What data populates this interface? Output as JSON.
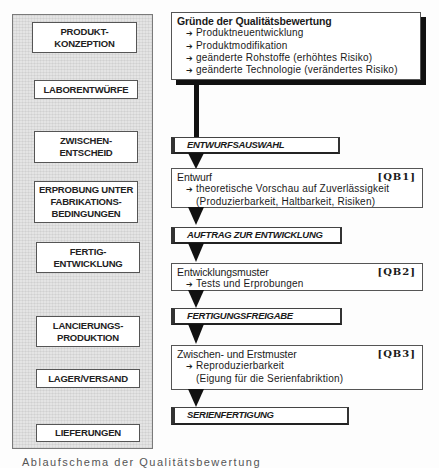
{
  "left_column": {
    "phases": [
      {
        "label": "PRODUKT-\nKONZEPTION"
      },
      {
        "label": "LABORENTWÜRFE"
      },
      {
        "label": "ZWISCHEN-\nENTSCHEID"
      },
      {
        "label": "ERPROBUNG UNTER\nFABRIKATIONS-\nBEDINGUNGEN"
      },
      {
        "label": "FERTIG-\nENTWICKLUNG"
      },
      {
        "label": "LANCIERUNGS-\nPRODUKTION"
      },
      {
        "label": "LAGER/VERSAND"
      },
      {
        "label": "LIEFERUNGEN"
      }
    ]
  },
  "right_column": {
    "reasons_box": {
      "title": "Gründe der Qualitätsbewertung",
      "items": [
        "Produktneuentwicklung",
        "Produktmodifikation",
        "geänderte Rohstoffe (erhöhtes Risiko)",
        "geänderte Technologie (verändertes Risiko)"
      ]
    },
    "milestones": [
      {
        "label": "ENTWURFSAUSWAHL"
      },
      {
        "label": "AUFTRAG ZUR ENTWICKLUNG"
      },
      {
        "label": "FERTIGUNGSFREIGABE"
      },
      {
        "label": "SERIENFERTIGUNG"
      }
    ],
    "evaluations": [
      {
        "title": "Entwurf",
        "tag": "[QB1]",
        "item": "theoretische Vorschau auf Zuverlässigkeit",
        "continuation": "(Produzierbarkeit, Haltbarkeit, Risiken)"
      },
      {
        "title": "Entwicklungsmuster",
        "tag": "[QB2]",
        "item": "Tests und Erprobungen",
        "continuation": ""
      },
      {
        "title": "Zwischen- und Erstmuster",
        "tag": "[QB3]",
        "item": "Reproduzierbarkeit",
        "continuation": "(Eigung für die Serienfabriktion)"
      }
    ],
    "arrow_glyph": "➔"
  },
  "caption": "Ablaufschema der Qualitätsbewertung",
  "colors": {
    "panel_fill": "#e4e4e4",
    "shadow": "#111111",
    "border": "#555555"
  }
}
